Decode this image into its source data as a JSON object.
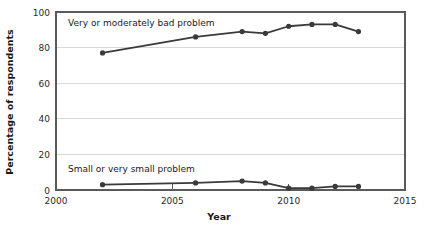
{
  "chart_data": {
    "type": "line",
    "title": "",
    "xlabel": "Year",
    "ylabel": "Percentage of respondents",
    "xlim": [
      2000,
      2015
    ],
    "ylim": [
      0,
      100
    ],
    "xticks": [
      2000,
      2005,
      2010,
      2015
    ],
    "xtick_labels": [
      "2000",
      "2005",
      "2010",
      "2015"
    ],
    "yticks": [
      0,
      20,
      40,
      60,
      80,
      100
    ],
    "ytick_labels": [
      "0",
      "20",
      "40",
      "60",
      "80",
      "100"
    ],
    "grid": "horizontal",
    "legend_position": "inline-annotations",
    "line_color": "#3a3a3a",
    "grid_color": "#d8d8d8",
    "axis_color": "#5a5a5a",
    "series": [
      {
        "name": "Very or moderately bad problem",
        "label_position": "above-line-left",
        "x": [
          2002,
          2006,
          2008,
          2009,
          2010,
          2011,
          2012,
          2013
        ],
        "values": [
          77,
          86,
          89,
          88,
          92,
          93,
          93,
          89
        ]
      },
      {
        "name": "Small or very small problem",
        "label_position": "above-line-left",
        "x": [
          2002,
          2006,
          2008,
          2009,
          2010,
          2011,
          2012,
          2013
        ],
        "values": [
          3,
          4,
          5,
          4,
          1,
          1,
          2,
          2
        ]
      }
    ]
  }
}
